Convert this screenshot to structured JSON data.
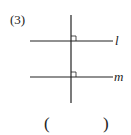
{
  "question": {
    "number": "(3)",
    "answer_open": "(",
    "answer_close": ")",
    "answer_value": ""
  },
  "diagram": {
    "lines": [
      {
        "name": "l",
        "label": "l",
        "type": "horizontal",
        "y": 41,
        "x1": 30,
        "x2": 113
      },
      {
        "name": "m",
        "label": "m",
        "type": "horizontal",
        "y": 77,
        "x1": 30,
        "x2": 113
      },
      {
        "name": "transversal",
        "label": "",
        "type": "vertical",
        "x": 71,
        "y1": 15,
        "y2": 103
      }
    ],
    "right_angle_marks": [
      {
        "at": "intersection-l",
        "x": 71,
        "y": 41,
        "size": 5
      },
      {
        "at": "intersection-m",
        "x": 71,
        "y": 77,
        "size": 5
      }
    ],
    "stroke_color": "#222222"
  }
}
